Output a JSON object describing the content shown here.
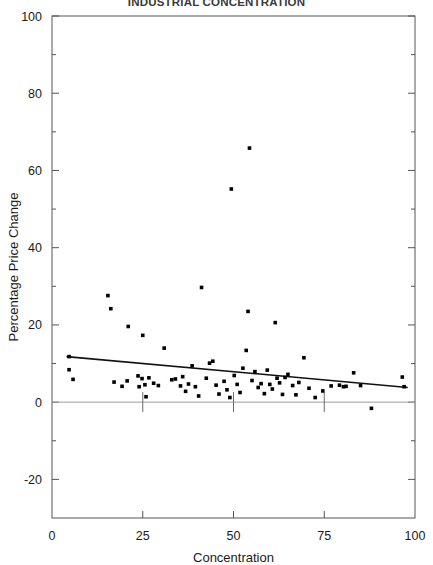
{
  "chart_data": {
    "type": "scatter",
    "title": "INDUSTRIAL CONCENTRATION",
    "xlabel": "Concentration",
    "ylabel": "Percentage Price Change",
    "xlim": [
      0,
      100
    ],
    "ylim": [
      -30,
      100
    ],
    "xticks": [
      0,
      25,
      50,
      75,
      100
    ],
    "xtick_labels": [
      "0",
      "25",
      "50",
      "75",
      "100"
    ],
    "yticks": [
      -20,
      0,
      20,
      40,
      60,
      80,
      100
    ],
    "ytick_labels": [
      "-20",
      "0",
      "20",
      "40",
      "60",
      "80",
      "100"
    ],
    "minor_ticks": true,
    "grid": false,
    "legend": null,
    "zero_reference_line": 0,
    "zero_line_ticks": [
      25,
      50,
      75
    ],
    "fit_line": {
      "name": "least-squares fit",
      "x_start": 4,
      "y_start": 11.8,
      "x_end": 98,
      "y_end": 3.8
    },
    "marker": "filled-square",
    "points": [
      {
        "x": 4.7,
        "y": 11.8
      },
      {
        "x": 4.7,
        "y": 8.4
      },
      {
        "x": 5.8,
        "y": 5.9
      },
      {
        "x": 15.4,
        "y": 27.6
      },
      {
        "x": 16.2,
        "y": 24.2
      },
      {
        "x": 17.1,
        "y": 5.2
      },
      {
        "x": 19.3,
        "y": 4.1
      },
      {
        "x": 20.7,
        "y": 5.5
      },
      {
        "x": 21.0,
        "y": 19.6
      },
      {
        "x": 23.7,
        "y": 6.8
      },
      {
        "x": 24.0,
        "y": 4.0
      },
      {
        "x": 24.8,
        "y": 6.1
      },
      {
        "x": 25.0,
        "y": 17.3
      },
      {
        "x": 25.6,
        "y": 4.5
      },
      {
        "x": 25.9,
        "y": 1.4
      },
      {
        "x": 26.7,
        "y": 6.3
      },
      {
        "x": 28.0,
        "y": 4.9
      },
      {
        "x": 29.3,
        "y": 4.3
      },
      {
        "x": 30.9,
        "y": 14.0
      },
      {
        "x": 33.0,
        "y": 5.8
      },
      {
        "x": 34.0,
        "y": 6.0
      },
      {
        "x": 35.4,
        "y": 4.2
      },
      {
        "x": 36.0,
        "y": 6.6
      },
      {
        "x": 36.8,
        "y": 2.8
      },
      {
        "x": 37.6,
        "y": 4.7
      },
      {
        "x": 38.6,
        "y": 9.4
      },
      {
        "x": 39.5,
        "y": 4.0
      },
      {
        "x": 40.4,
        "y": 1.6
      },
      {
        "x": 41.2,
        "y": 29.7
      },
      {
        "x": 42.5,
        "y": 6.2
      },
      {
        "x": 43.4,
        "y": 10.1
      },
      {
        "x": 44.3,
        "y": 10.6
      },
      {
        "x": 45.2,
        "y": 4.4
      },
      {
        "x": 46.0,
        "y": 2.1
      },
      {
        "x": 47.4,
        "y": 5.4
      },
      {
        "x": 48.2,
        "y": 3.2
      },
      {
        "x": 49.0,
        "y": 1.2
      },
      {
        "x": 49.4,
        "y": 55.2
      },
      {
        "x": 50.2,
        "y": 6.9
      },
      {
        "x": 51.0,
        "y": 4.6
      },
      {
        "x": 51.8,
        "y": 2.5
      },
      {
        "x": 52.6,
        "y": 8.8
      },
      {
        "x": 53.5,
        "y": 13.4
      },
      {
        "x": 54.0,
        "y": 23.5
      },
      {
        "x": 54.4,
        "y": 65.8
      },
      {
        "x": 55.1,
        "y": 5.6
      },
      {
        "x": 55.9,
        "y": 7.9
      },
      {
        "x": 56.8,
        "y": 3.8
      },
      {
        "x": 57.6,
        "y": 4.8
      },
      {
        "x": 58.5,
        "y": 2.2
      },
      {
        "x": 59.3,
        "y": 8.3
      },
      {
        "x": 60.0,
        "y": 4.6
      },
      {
        "x": 60.7,
        "y": 3.4
      },
      {
        "x": 61.5,
        "y": 20.6
      },
      {
        "x": 62.0,
        "y": 6.2
      },
      {
        "x": 62.7,
        "y": 5.0
      },
      {
        "x": 63.5,
        "y": 2.0
      },
      {
        "x": 64.2,
        "y": 6.4
      },
      {
        "x": 65.0,
        "y": 7.2
      },
      {
        "x": 66.3,
        "y": 4.3
      },
      {
        "x": 67.2,
        "y": 1.9
      },
      {
        "x": 68.0,
        "y": 5.1
      },
      {
        "x": 69.4,
        "y": 11.5
      },
      {
        "x": 70.8,
        "y": 3.6
      },
      {
        "x": 72.5,
        "y": 1.2
      },
      {
        "x": 74.6,
        "y": 2.9
      },
      {
        "x": 76.9,
        "y": 4.2
      },
      {
        "x": 79.2,
        "y": 4.4
      },
      {
        "x": 80.3,
        "y": 4.0
      },
      {
        "x": 81.0,
        "y": 4.1
      },
      {
        "x": 83.1,
        "y": 7.6
      },
      {
        "x": 85.0,
        "y": 4.3
      },
      {
        "x": 88.0,
        "y": -1.6
      },
      {
        "x": 96.5,
        "y": 6.5
      },
      {
        "x": 97.0,
        "y": 4.0
      }
    ]
  }
}
